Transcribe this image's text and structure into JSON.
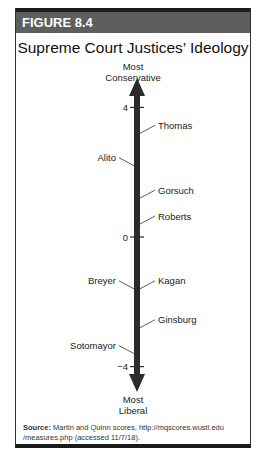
{
  "figure": {
    "label": "FIGURE 8.4",
    "title": "Supreme Court Justices’ Ideology",
    "top_label_line1": "Most",
    "top_label_line2": "Conservative",
    "bottom_label_line1": "Most",
    "bottom_label_line2": "Liberal",
    "source_label": "Source:",
    "source_text": " Martin and Quinn scores, http://mqscores.wustl.edu /measures.php (accessed 11/7/18)."
  },
  "chart_data": {
    "type": "scatter",
    "title": "Supreme Court Justices’ Ideology",
    "xlabel": "",
    "ylabel": "Ideology (Martin-Quinn score)",
    "axis_top_label": "Most Conservative",
    "axis_bottom_label": "Most Liberal",
    "ylim": [
      -5,
      5
    ],
    "ticks": [
      4,
      0,
      -4
    ],
    "tick_labels": [
      "4",
      "0",
      "−4"
    ],
    "points": [
      {
        "name": "Thomas",
        "value": 3.2,
        "side": "right"
      },
      {
        "name": "Alito",
        "value": 2.2,
        "side": "left"
      },
      {
        "name": "Gorsuch",
        "value": 1.2,
        "side": "right"
      },
      {
        "name": "Roberts",
        "value": 0.4,
        "side": "right"
      },
      {
        "name": "Breyer",
        "value": -1.6,
        "side": "left"
      },
      {
        "name": "Kagan",
        "value": -1.6,
        "side": "right"
      },
      {
        "name": "Ginsburg",
        "value": -2.8,
        "side": "right"
      },
      {
        "name": "Sotomayor",
        "value": -3.6,
        "side": "left"
      }
    ],
    "colors": {
      "axis": "#2b2b2b",
      "header": "#5e5e5e"
    }
  }
}
